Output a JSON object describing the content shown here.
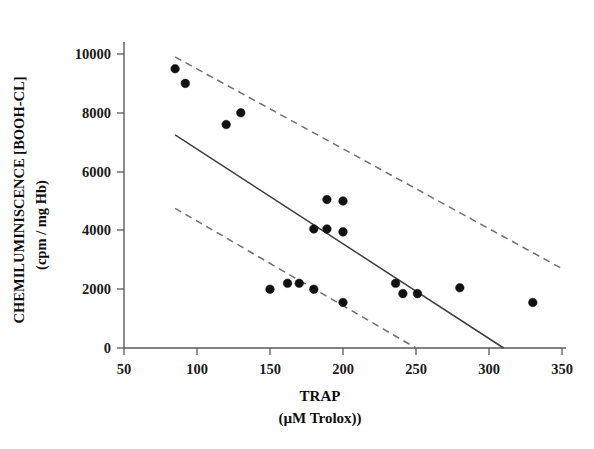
{
  "chart_data": {
    "type": "scatter",
    "title": "",
    "xlabel": "TRAP",
    "xlabel_units": "(µM Trolox))",
    "ylabel": "CHEMILUMINISCENCE [BOOH-CL]",
    "ylabel_units": "(cpm / mg Hb)",
    "xlim": [
      50,
      350
    ],
    "ylim": [
      0,
      10600
    ],
    "xticks": [
      50,
      100,
      150,
      200,
      250,
      300,
      350
    ],
    "xticklabels": [
      "50",
      "100",
      "150",
      "200",
      "250",
      "300",
      "350"
    ],
    "yticks": [
      0,
      2000,
      4000,
      6000,
      8000,
      10000
    ],
    "yticklabels": [
      "0",
      "2000",
      "4000",
      "6000",
      "8000",
      "10000"
    ],
    "grid": false,
    "legend": "none",
    "marker": "filled-circle",
    "marker_color": "#111111",
    "points": [
      {
        "x": 85,
        "y": 9500
      },
      {
        "x": 92,
        "y": 9000
      },
      {
        "x": 120,
        "y": 7600
      },
      {
        "x": 130,
        "y": 8000
      },
      {
        "x": 150,
        "y": 2000
      },
      {
        "x": 162,
        "y": 2200
      },
      {
        "x": 170,
        "y": 2200
      },
      {
        "x": 180,
        "y": 2000
      },
      {
        "x": 180,
        "y": 4050
      },
      {
        "x": 189,
        "y": 4050
      },
      {
        "x": 189,
        "y": 5050
      },
      {
        "x": 200,
        "y": 3950
      },
      {
        "x": 200,
        "y": 1550
      },
      {
        "x": 200,
        "y": 5000
      },
      {
        "x": 236,
        "y": 2200
      },
      {
        "x": 241,
        "y": 1850
      },
      {
        "x": 251,
        "y": 1850
      },
      {
        "x": 280,
        "y": 2050
      },
      {
        "x": 330,
        "y": 1550
      }
    ],
    "fit_line": {
      "name": "regression-line",
      "style": "solid",
      "x1": 85,
      "y1": 7250,
      "x2": 310,
      "y2": 0
    },
    "confidence_band_upper": {
      "name": "upper-confidence-band",
      "style": "dashed",
      "x1": 85,
      "y1": 9900,
      "x2": 350,
      "y2": 2700
    },
    "confidence_band_lower": {
      "name": "lower-confidence-band",
      "style": "dashed",
      "x1": 85,
      "y1": 4750,
      "x2": 250,
      "y2": 0
    }
  }
}
